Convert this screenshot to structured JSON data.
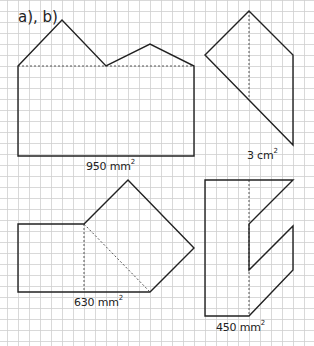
{
  "title": "a), b)",
  "grid": {
    "cell": 11,
    "origin_x": 18,
    "origin_y": 0,
    "color": "#cfcfcf"
  },
  "colors": {
    "stroke": "#222222",
    "dashed": "#555555",
    "background": "#ffffff"
  },
  "figures": [
    {
      "id": "figure-1",
      "area_value": "950 mm",
      "area_exp": "2",
      "label_pos": [
        86,
        160
      ],
      "outline": [
        [
          18,
          66
        ],
        [
          62,
          20
        ],
        [
          106,
          66
        ],
        [
          150,
          44
        ],
        [
          194,
          66
        ],
        [
          194,
          156
        ],
        [
          18,
          156
        ]
      ],
      "dashed": [
        [
          [
            18,
            66
          ],
          [
            194,
            66
          ]
        ]
      ]
    },
    {
      "id": "figure-2",
      "area_value": "3 cm",
      "area_exp": "2",
      "label_pos": [
        247,
        149
      ],
      "outline": [
        [
          249,
          11
        ],
        [
          293,
          55
        ],
        [
          293,
          145
        ],
        [
          205,
          55
        ]
      ],
      "dashed": [
        [
          [
            249,
            11
          ],
          [
            249,
            99
          ]
        ]
      ]
    },
    {
      "id": "figure-3",
      "area_value": "630 mm",
      "area_exp": "2",
      "label_pos": [
        74,
        296
      ],
      "outline": [
        [
          18,
          224
        ],
        [
          84,
          224
        ],
        [
          128,
          180
        ],
        [
          194,
          248
        ],
        [
          150,
          292
        ],
        [
          18,
          292
        ]
      ],
      "dashed": [
        [
          [
            84,
            224
          ],
          [
            84,
            292
          ]
        ],
        [
          [
            84,
            224
          ],
          [
            150,
            292
          ]
        ]
      ]
    },
    {
      "id": "figure-4",
      "area_value": "450 mm",
      "area_exp": "2",
      "label_pos": [
        216,
        321
      ],
      "outline": [
        [
          205,
          180
        ],
        [
          293,
          180
        ],
        [
          249,
          224
        ],
        [
          249,
          270
        ],
        [
          293,
          226
        ],
        [
          293,
          270
        ],
        [
          249,
          316
        ],
        [
          205,
          316
        ]
      ],
      "dashed": [
        [
          [
            249,
            180
          ],
          [
            249,
            316
          ]
        ]
      ]
    }
  ]
}
